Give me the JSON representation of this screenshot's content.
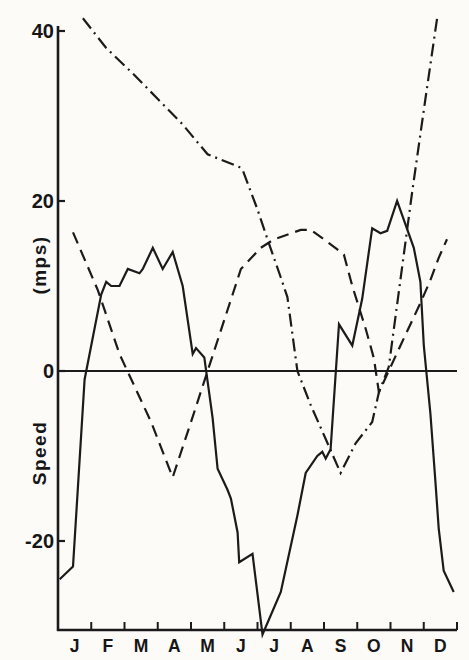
{
  "page": {
    "background_color": "#fcfbf8",
    "ink_color": "#1b1b1b"
  },
  "chart_data": {
    "type": "line",
    "title": "",
    "xlabel": "",
    "ylabel": "Speed (mps)",
    "ylabel_parts": [
      "Speed",
      "(mps)"
    ],
    "x_tick_labels": [
      "J",
      "F",
      "M",
      "A",
      "M",
      "J",
      "J",
      "A",
      "S",
      "O",
      "N",
      "D"
    ],
    "y_ticks": [
      {
        "value": 40,
        "label": "40"
      },
      {
        "value": 20,
        "label": "20"
      },
      {
        "value": 0,
        "label": "0"
      },
      {
        "value": -20,
        "label": "-20"
      }
    ],
    "xlim": [
      0,
      12
    ],
    "ylim": [
      -31.5,
      42
    ],
    "grid": false,
    "legend": "none",
    "zero_line": true,
    "x_axis_note": "months January through December; ticks mark month boundaries, letters centered in each month",
    "series": [
      {
        "name": "solid-curve",
        "line_style": "solid",
        "points": [
          [
            0.05,
            -24.5
          ],
          [
            0.45,
            -23
          ],
          [
            0.8,
            -1
          ],
          [
            1.3,
            9
          ],
          [
            1.45,
            10.5
          ],
          [
            1.6,
            10
          ],
          [
            1.85,
            10
          ],
          [
            2.1,
            12
          ],
          [
            2.45,
            11.5
          ],
          [
            2.55,
            12
          ],
          [
            2.85,
            14.5
          ],
          [
            3.15,
            12
          ],
          [
            3.45,
            14
          ],
          [
            3.75,
            10
          ],
          [
            4.05,
            2
          ],
          [
            4.15,
            2.7
          ],
          [
            4.4,
            1.6
          ],
          [
            4.65,
            -5.5
          ],
          [
            4.8,
            -11.5
          ],
          [
            5.1,
            -14
          ],
          [
            5.2,
            -15
          ],
          [
            5.4,
            -19
          ],
          [
            5.45,
            -22.5
          ],
          [
            5.85,
            -21.5
          ],
          [
            6.15,
            -31
          ],
          [
            6.7,
            -26
          ],
          [
            7.2,
            -17
          ],
          [
            7.45,
            -12
          ],
          [
            7.8,
            -10
          ],
          [
            7.95,
            -9.5
          ],
          [
            8.05,
            -10.3
          ],
          [
            8.2,
            -9.2
          ],
          [
            8.45,
            5.5
          ],
          [
            8.85,
            3
          ],
          [
            9.15,
            8.5
          ],
          [
            9.45,
            16.8
          ],
          [
            9.7,
            16.2
          ],
          [
            9.9,
            16.5
          ],
          [
            10.2,
            20
          ],
          [
            10.7,
            14.5
          ],
          [
            10.9,
            10.5
          ],
          [
            11.0,
            3
          ],
          [
            11.2,
            -5
          ],
          [
            11.35,
            -13
          ],
          [
            11.45,
            -18.5
          ],
          [
            11.6,
            -23.5
          ],
          [
            11.9,
            -26
          ]
        ]
      },
      {
        "name": "dashed-curve",
        "line_style": "dashed",
        "points": [
          [
            0.45,
            16.3
          ],
          [
            1.2,
            9.5
          ],
          [
            1.85,
            2
          ],
          [
            2.8,
            -6
          ],
          [
            3.45,
            -12.5
          ],
          [
            4.0,
            -6
          ],
          [
            4.5,
            0
          ],
          [
            5.25,
            9
          ],
          [
            5.5,
            12
          ],
          [
            6.1,
            14.5
          ],
          [
            6.5,
            15.5
          ],
          [
            7.3,
            16.6
          ],
          [
            7.6,
            16.6
          ],
          [
            8.0,
            15.5
          ],
          [
            8.4,
            14.3
          ],
          [
            8.6,
            13.7
          ],
          [
            8.85,
            10
          ],
          [
            9.25,
            5
          ],
          [
            9.5,
            1.5
          ],
          [
            9.65,
            -2.5
          ],
          [
            10.3,
            3
          ],
          [
            10.9,
            8
          ],
          [
            11.2,
            10.7
          ],
          [
            11.45,
            13.3
          ],
          [
            11.7,
            15.5
          ]
        ]
      },
      {
        "name": "dash-dot-curve",
        "line_style": "dash-dot",
        "points": [
          [
            0.75,
            41.5
          ],
          [
            1.45,
            38
          ],
          [
            2.25,
            35
          ],
          [
            3.0,
            32
          ],
          [
            3.75,
            29
          ],
          [
            4.5,
            25.5
          ],
          [
            5.45,
            24
          ],
          [
            5.55,
            23.7
          ],
          [
            6.0,
            19
          ],
          [
            6.3,
            15.5
          ],
          [
            6.7,
            11
          ],
          [
            6.9,
            8.7
          ],
          [
            7.2,
            0
          ],
          [
            7.6,
            -4
          ],
          [
            8.05,
            -8
          ],
          [
            8.5,
            -12
          ],
          [
            8.95,
            -8.5
          ],
          [
            9.45,
            -6
          ],
          [
            9.65,
            -2.5
          ],
          [
            9.95,
            0.5
          ],
          [
            10.65,
            21
          ],
          [
            11.05,
            32
          ],
          [
            11.4,
            41.5
          ]
        ]
      }
    ]
  }
}
